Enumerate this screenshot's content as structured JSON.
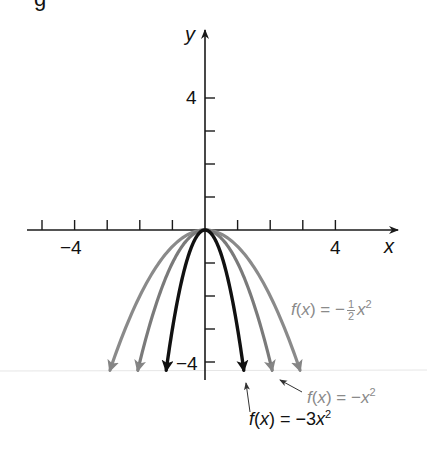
{
  "header": {
    "cut_off_text_fragment": "g"
  },
  "axes": {
    "x_label": "x",
    "y_label": "y",
    "x_tick_labels": [
      {
        "value": -4,
        "text": "−4"
      },
      {
        "value": 4,
        "text": "4"
      }
    ],
    "y_tick_labels": [
      {
        "value": 4,
        "text": "4"
      },
      {
        "value": -4,
        "text": "−4"
      }
    ],
    "x_ticks": [
      -5,
      -4,
      -3,
      -2,
      -1,
      1,
      2,
      3,
      4
    ],
    "y_ticks": [
      4,
      3,
      2,
      1,
      -1,
      -2,
      -3,
      -4
    ],
    "xlim": [
      -5.4,
      5.8
    ],
    "ylim": [
      -4.5,
      6
    ]
  },
  "curves": [
    {
      "name": "f(x) = -1/2 x^2",
      "coefficient": -0.5,
      "color": "#8a8a8a",
      "stroke_width": 3.2
    },
    {
      "name": "f(x) = -x^2",
      "coefficient": -1,
      "color": "#7a7a7a",
      "stroke_width": 3.2
    },
    {
      "name": "f(x) = -3x^2",
      "coefficient": -3,
      "color": "#111111",
      "stroke_width": 3.4
    }
  ],
  "labels": {
    "half": {
      "prefix_f": "f",
      "prefix_rest": "(",
      "x": "x",
      "close": ") = −",
      "num": "1",
      "den": "2",
      "var": "x",
      "exp": "2"
    },
    "neg_one": {
      "f": "f",
      "open": "(",
      "x": "x",
      "close": ") = −",
      "var": "x",
      "exp": "2"
    },
    "neg_three": {
      "f": "f",
      "open": "(",
      "x": "x",
      "close": ") = −3",
      "var": "x",
      "exp": "2"
    }
  },
  "colors": {
    "axis": "#1a1a1a",
    "dark_curve": "#111111",
    "gray_curve": "#8a8a8a",
    "gray_text": "#8a8a8a"
  }
}
